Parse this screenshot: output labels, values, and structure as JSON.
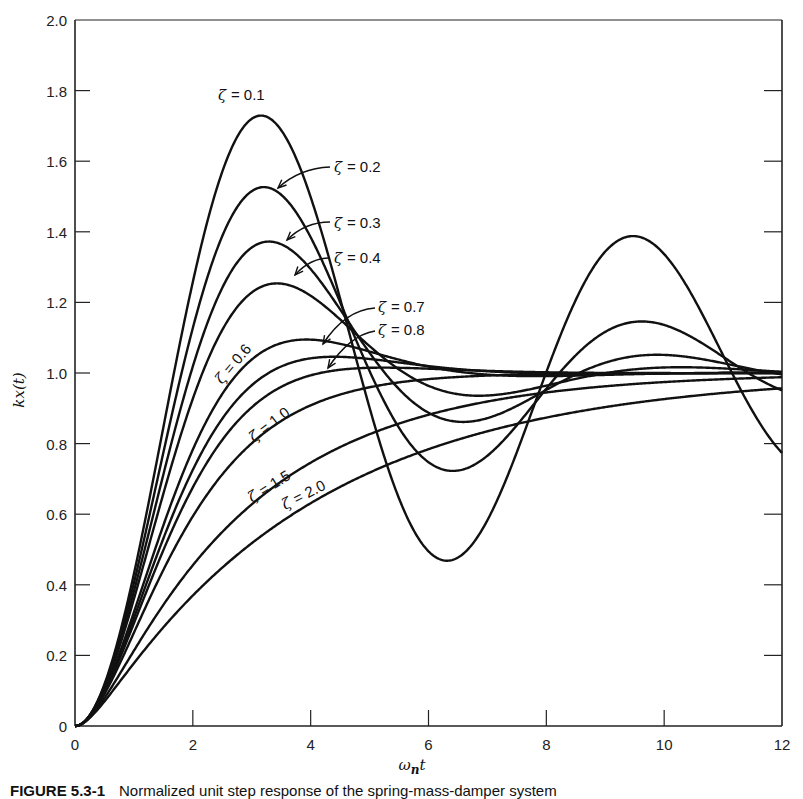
{
  "chart_data": {
    "type": "line",
    "title": "",
    "xlabel": "ω_n t",
    "ylabel": "kx(t)",
    "xlim": [
      0,
      12
    ],
    "ylim": [
      0,
      2.0
    ],
    "x_ticks": [
      "0",
      "2",
      "4",
      "6",
      "8",
      "10",
      "12"
    ],
    "y_ticks": [
      "0",
      "0.2",
      "0.4",
      "0.6",
      "0.8",
      "1.0",
      "1.2",
      "1.4",
      "1.6",
      "1.8",
      "2.0"
    ],
    "grid": false,
    "legend": "inline curve labels",
    "series": [
      {
        "name": "ζ = 0.1",
        "zeta": 0.1,
        "peak": {
          "x": 3.16,
          "y": 1.73
        }
      },
      {
        "name": "ζ = 0.2",
        "zeta": 0.2,
        "peak": {
          "x": 3.21,
          "y": 1.53
        }
      },
      {
        "name": "ζ = 0.3",
        "zeta": 0.3,
        "peak": {
          "x": 3.29,
          "y": 1.37
        }
      },
      {
        "name": "ζ = 0.4",
        "zeta": 0.4,
        "peak": {
          "x": 3.43,
          "y": 1.25
        }
      },
      {
        "name": "ζ = 0.6",
        "zeta": 0.6,
        "peak": {
          "x": 3.93,
          "y": 1.09
        }
      },
      {
        "name": "ζ = 0.7",
        "zeta": 0.7,
        "peak": {
          "x": 4.4,
          "y": 1.05
        }
      },
      {
        "name": "ζ = 0.8",
        "zeta": 0.8,
        "peak": {
          "x": 5.24,
          "y": 1.02
        }
      },
      {
        "name": "ζ = 1.0",
        "zeta": 1.0
      },
      {
        "name": "ζ = 1.5",
        "zeta": 1.5
      },
      {
        "name": "ζ = 2.0",
        "zeta": 2.0
      }
    ],
    "sample_values": {
      "x": [
        0,
        1,
        2,
        3,
        4,
        5,
        6,
        7,
        8,
        9,
        10,
        11,
        12
      ],
      "zeta_0.1": [
        0,
        0.46,
        1.32,
        1.73,
        1.47,
        0.89,
        0.53,
        0.65,
        1.07,
        1.34,
        1.31,
        1.03,
        0.78
      ],
      "zeta_1.0": [
        0,
        0.26,
        0.59,
        0.8,
        0.91,
        0.96,
        0.98,
        0.99,
        1.0,
        1.0,
        1.0,
        1.0,
        1.0
      ],
      "zeta_2.0": [
        0,
        0.16,
        0.4,
        0.56,
        0.67,
        0.75,
        0.81,
        0.85,
        0.89,
        0.91,
        0.93,
        0.95,
        0.96
      ]
    }
  },
  "labels": {
    "x_axis_title_main": "ω",
    "x_axis_title_sub": "n",
    "x_axis_title_tail": "t",
    "y_axis_title": "kx(t)",
    "zeta_symbol": "ζ",
    "curve_values": [
      "= 0.1",
      "= 0.2",
      "= 0.3",
      "= 0.4",
      "= 0.6",
      "= 0.7",
      "= 0.8",
      "= 1.0",
      "= 1.5",
      "= 2.0"
    ]
  },
  "caption": {
    "figure_number": "FIGURE 5.3-1",
    "text": "Normalized unit step response of the spring-mass-damper system"
  }
}
